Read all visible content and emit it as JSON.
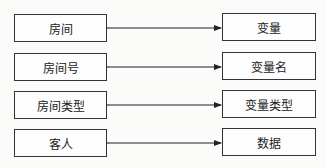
{
  "diagram": {
    "type": "bidirectional-mapping",
    "pairs": [
      {
        "left": "房间",
        "right": "变量"
      },
      {
        "left": "房间号",
        "right": "变量名"
      },
      {
        "left": "房间类型",
        "right": "变量类型"
      },
      {
        "left": "客人",
        "right": "数据"
      }
    ]
  }
}
